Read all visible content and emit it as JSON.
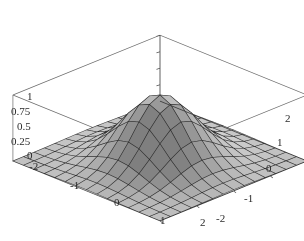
{
  "figure": {
    "kind": "surface-plot-3d",
    "width": 304,
    "height": 241,
    "background": "#ffffff",
    "frame_color": "#555555",
    "mesh_color": "#3a3a3a",
    "surface_light": "#e8e8e8",
    "surface_mid": "#9a9a9a",
    "surface_dark": "#6e6e6e"
  },
  "chart_data": {
    "type": "surface",
    "title": "",
    "xlabel": "",
    "ylabel": "",
    "zlabel": "",
    "grid": true,
    "legend": "none",
    "function": "exp(-(x^2 + y^2))",
    "xlim": [
      -2,
      2
    ],
    "ylim": [
      -2,
      2
    ],
    "zlim": [
      0,
      1
    ],
    "x_ticks": [
      -2,
      -1,
      0,
      1,
      2
    ],
    "x_tick_labels": [
      "-2",
      "-1",
      "0",
      "1",
      "2"
    ],
    "y_ticks": [
      -2,
      -1,
      0,
      1,
      2
    ],
    "y_tick_labels": [
      "-2",
      "-1",
      "0",
      "1",
      "2"
    ],
    "z_ticks": [
      0,
      0.25,
      0.5,
      0.75,
      1
    ],
    "z_tick_labels": [
      "0",
      "0.25",
      "0.5",
      "0.75",
      "1"
    ],
    "mesh_divisions": 14,
    "peak": {
      "x": 0,
      "y": 0,
      "z": 1
    },
    "view": {
      "azimuth_deg": 45,
      "elevation_deg": 24
    }
  },
  "axis_labels": {
    "z": [
      {
        "text": "1",
        "x": 27,
        "y": 91
      },
      {
        "text": "0.75",
        "x": 11,
        "y": 106
      },
      {
        "text": "0.5",
        "x": 17,
        "y": 121
      },
      {
        "text": "0.25",
        "x": 11,
        "y": 136
      },
      {
        "text": "0",
        "x": 27,
        "y": 150
      }
    ],
    "x_front_left": [
      {
        "text": "-2",
        "x": 29,
        "y": 161
      },
      {
        "text": "-1",
        "x": 70,
        "y": 180
      },
      {
        "text": "0",
        "x": 114,
        "y": 197
      },
      {
        "text": "1",
        "x": 160,
        "y": 215
      },
      {
        "text": "2",
        "x": 200,
        "y": 217
      }
    ],
    "y_front_right": [
      {
        "text": "-2",
        "x": 216,
        "y": 213
      },
      {
        "text": "-1",
        "x": 244,
        "y": 193
      },
      {
        "text": "0",
        "x": 266,
        "y": 163
      },
      {
        "text": "1",
        "x": 277,
        "y": 137
      },
      {
        "text": "2",
        "x": 285,
        "y": 113
      }
    ]
  }
}
